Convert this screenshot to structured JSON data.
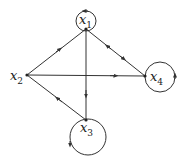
{
  "diagram": {
    "type": "directed-graph",
    "nodes": [
      {
        "id": "x1",
        "label": "x",
        "sub": "1",
        "self_loop": true
      },
      {
        "id": "x2",
        "label": "x",
        "sub": "2",
        "self_loop": false
      },
      {
        "id": "x3",
        "label": "x",
        "sub": "3",
        "self_loop": true
      },
      {
        "id": "x4",
        "label": "x",
        "sub": "4",
        "self_loop": true
      }
    ],
    "edges": [
      {
        "from": "x2",
        "to": "x1"
      },
      {
        "from": "x2",
        "to": "x4"
      },
      {
        "from": "x1",
        "to": "x3"
      },
      {
        "from": "x3",
        "to": "x2"
      },
      {
        "from": "x1",
        "to": "x4"
      },
      {
        "from": "x4",
        "to": "x1"
      }
    ],
    "colors": {
      "stroke": "#333333",
      "background": "#ffffff"
    }
  }
}
